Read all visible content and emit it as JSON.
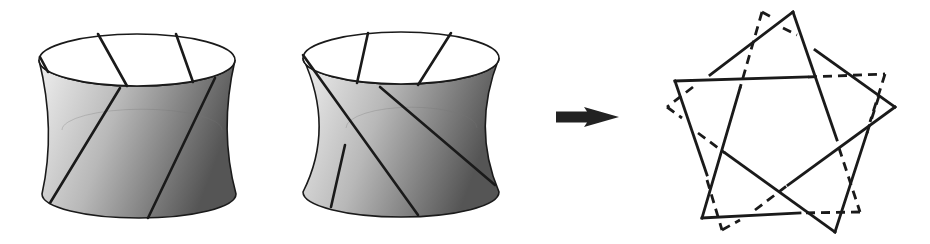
{
  "figure": {
    "colors": {
      "ink": "#1a1a1a",
      "shade_light": "#ececec",
      "shade_mid": "#b4b4b4",
      "shade_dark": "#5a5a5a"
    }
  },
  "hyperboloids": [
    {
      "name": "left-hyperboloid",
      "top": {
        "cx": 137,
        "cy": 60,
        "rx": 98,
        "ry": 26
      },
      "bottom": {
        "cx": 139,
        "cy": 194,
        "rx": 97,
        "ry": 24
      },
      "waist": {
        "xl": 62,
        "xr": 222,
        "y": 130
      },
      "back_rulings": [
        [
          98,
          34,
          127,
          86
        ],
        [
          176,
          34,
          193,
          82
        ]
      ],
      "front_rulings": [
        [
          120,
          88,
          50,
          203
        ],
        [
          215,
          78,
          148,
          218
        ],
        [
          40,
          57,
          48,
          72
        ]
      ]
    },
    {
      "name": "right-hyperboloid",
      "top": {
        "cx": 401,
        "cy": 58,
        "rx": 98,
        "ry": 26
      },
      "bottom": {
        "cx": 401,
        "cy": 192,
        "rx": 98,
        "ry": 25
      },
      "waist": {
        "xl": 346,
        "xr": 477,
        "y": 128
      },
      "back_rulings": [
        [
          368,
          33,
          357,
          83
        ],
        [
          451,
          33,
          418,
          85
        ]
      ],
      "front_rulings": [
        [
          303,
          55,
          418,
          215
        ],
        [
          380,
          87,
          495,
          185
        ],
        [
          345,
          145,
          331,
          207
        ]
      ]
    }
  ],
  "arrow": {
    "x1": 556,
    "x2": 619,
    "y": 117,
    "shaft_h": 11,
    "head_w": 32,
    "head_h": 20
  },
  "knot": {
    "solid": [
      [
        675,
        81,
        807,
        77
      ],
      [
        675,
        81,
        707,
        175
      ],
      [
        793,
        12,
        837,
        140
      ],
      [
        793,
        12,
        710,
        75
      ],
      [
        815,
        50,
        895,
        107
      ],
      [
        895,
        107,
        788,
        185
      ],
      [
        740,
        88,
        702,
        218
      ],
      [
        702,
        218,
        800,
        213
      ],
      [
        725,
        153,
        835,
        232
      ],
      [
        835,
        232,
        867,
        133
      ]
    ],
    "dashed": [
      [
        808,
        77,
        885,
        74
      ],
      [
        885,
        74,
        870,
        122
      ],
      [
        867,
        133,
        880,
        93
      ],
      [
        839,
        148,
        860,
        212
      ],
      [
        860,
        212,
        800,
        213
      ],
      [
        762,
        12,
        773,
        18
      ],
      [
        762,
        12,
        740,
        88
      ],
      [
        783,
        28,
        797,
        35
      ],
      [
        693,
        87,
        667,
        107
      ],
      [
        667,
        107,
        682,
        118
      ],
      [
        698,
        133,
        725,
        153
      ],
      [
        707,
        180,
        722,
        230
      ],
      [
        722,
        230,
        740,
        220
      ],
      [
        755,
        210,
        788,
        185
      ]
    ]
  }
}
